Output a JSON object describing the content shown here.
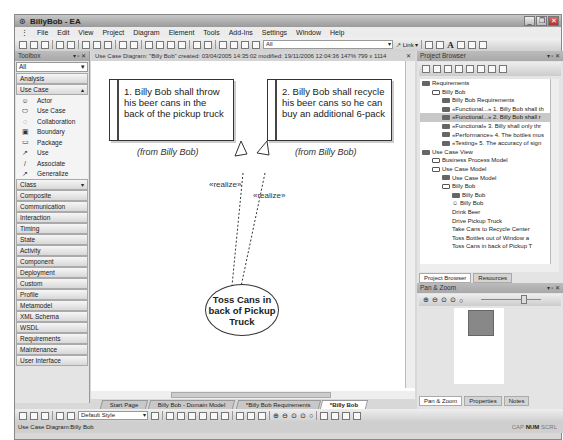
{
  "window": {
    "title": "BillyBob - EA"
  },
  "menu": [
    "File",
    "Edit",
    "View",
    "Project",
    "Diagram",
    "Element",
    "Tools",
    "Add-Ins",
    "Settings",
    "Window",
    "Help"
  ],
  "toolbar": {
    "filter_value": "All",
    "link_label": "Link"
  },
  "toolbox": {
    "title": "Toolbox",
    "combo_value": "All",
    "groups_top": [
      "Analysis"
    ],
    "expanded_group": "Use Case",
    "tools": [
      {
        "label": "Actor",
        "icon": "actor-icon",
        "glyph": "☺"
      },
      {
        "label": "Use Case",
        "icon": "use-case-icon",
        "glyph": "⬭"
      },
      {
        "label": "Collaboration",
        "icon": "collaboration-icon",
        "glyph": "◌"
      },
      {
        "label": "Boundary",
        "icon": "boundary-icon",
        "glyph": "▣"
      },
      {
        "label": "Package",
        "icon": "package-icon",
        "glyph": "▭"
      },
      {
        "label": "Use",
        "icon": "use-arrow-icon",
        "glyph": "↗"
      },
      {
        "label": "Associate",
        "icon": "associate-icon",
        "glyph": "/"
      },
      {
        "label": "Generalize",
        "icon": "generalize-icon",
        "glyph": "↗"
      }
    ],
    "groups_bottom": [
      "Class",
      "Composite",
      "Communication",
      "Interaction",
      "Timing",
      "State",
      "Activity",
      "Component",
      "Deployment",
      "Custom",
      "Profile",
      "Metamodel",
      "XML Schema",
      "WSDL",
      "Requirements",
      "Maintenance",
      "User Interface"
    ]
  },
  "diagram": {
    "header": "Use Case Diagram: \"Billy Bob\"   created: 03/04/2005 14:35:02  modified: 19/11/2006 12:04:36   147%   799 x 1114",
    "req1": "1. Billy Bob shall throw his beer cans in the back of the pickup truck",
    "req2": "2. Billy Bob shall recycle his beer cans so he can buy an additional 6-pack",
    "from1": "(from Billy Bob)",
    "from2": "(from Billy Bob)",
    "realize1": "«realize»",
    "realize2": "«realize»",
    "usecase": "Toss Cans in back of Pickup Truck"
  },
  "tabs": [
    "Start Page",
    "Billy Bob - Domain Model",
    "*Billy Bob Requirements",
    "*Billy Bob"
  ],
  "bottom_toolbar": {
    "style_value": "Default Style"
  },
  "status": {
    "left": "Use Case Diagram:Billy Bob",
    "cap": "CAP",
    "num": "NUM",
    "scrl": "SCRL"
  },
  "project_browser": {
    "title": "Project Browser",
    "nodes": [
      {
        "label": "Requirements",
        "indent": 0,
        "icon": "view"
      },
      {
        "label": "Billy Bob",
        "indent": 1,
        "icon": "folder"
      },
      {
        "label": "Billy Bob Requirements",
        "indent": 2,
        "icon": "diagram"
      },
      {
        "label": "«Functional...» 1. Billy Bob shall th",
        "indent": 2,
        "icon": "req"
      },
      {
        "label": "«Functional...» 2. Billy Bob shall r",
        "indent": 2,
        "icon": "req",
        "selected": true
      },
      {
        "label": "«Functional» 3. Billy shall only thr",
        "indent": 2,
        "icon": "req"
      },
      {
        "label": "«Performance» 4. The bottles mus",
        "indent": 2,
        "icon": "req"
      },
      {
        "label": "«Testing» 5. The accuracy of sign",
        "indent": 2,
        "icon": "req"
      },
      {
        "label": "Use Case View",
        "indent": 0,
        "icon": "view"
      },
      {
        "label": "Business Process Model",
        "indent": 1,
        "icon": "folder"
      },
      {
        "label": "Use Case Model",
        "indent": 1,
        "icon": "folder"
      },
      {
        "label": "Use Case Model",
        "indent": 2,
        "icon": "diagram"
      },
      {
        "label": "Billy Bob",
        "indent": 2,
        "icon": "folder"
      },
      {
        "label": "Billy Bob",
        "indent": 3,
        "icon": "diagram"
      },
      {
        "label": "Billy Bob",
        "indent": 3,
        "icon": "actor"
      },
      {
        "label": "Drink Beer",
        "indent": 3,
        "icon": "uc"
      },
      {
        "label": "Drive Pickup Truck",
        "indent": 3,
        "icon": "uc"
      },
      {
        "label": "Take Cans to Recycle Center",
        "indent": 3,
        "icon": "uc"
      },
      {
        "label": "Toss Bottles out of Window a",
        "indent": 3,
        "icon": "uc"
      },
      {
        "label": "Toss Cans in back of Pickup T",
        "indent": 3,
        "icon": "uc"
      }
    ],
    "tabs": [
      "Project Browser",
      "Resources"
    ]
  },
  "pan_zoom": {
    "title": "Pan & Zoom",
    "tabs": [
      "Pan & Zoom",
      "Properties",
      "Notes"
    ]
  }
}
